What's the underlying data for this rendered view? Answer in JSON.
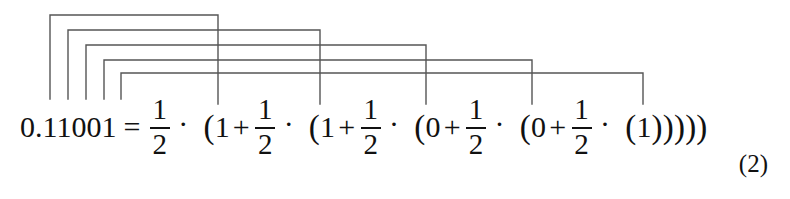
{
  "figure": {
    "kind": "math-equation-with-horner-brackets",
    "equation_number": "(2)",
    "ink_color": "#111111",
    "bracket_color": "#555555",
    "background": "#ffffff"
  },
  "equation": {
    "lhs": "0.11001",
    "equals": "=",
    "dot": "·",
    "plus": "+",
    "open_paren": "(",
    "close_paren": ")",
    "fraction": {
      "numerator": "1",
      "denominator": "2"
    },
    "terms": [
      {
        "digit": "1"
      },
      {
        "digit": "1"
      },
      {
        "digit": "0"
      },
      {
        "digit": "0"
      },
      {
        "digit": "1"
      }
    ],
    "closing_parens": ")))))",
    "plain_text": "0.11001 = 1/2 · (1 + 1/2 · (1 + 1/2 · (0 + 1/2 · (0 + 1/2 · (1)))))"
  },
  "brackets": {
    "description": "Five nested connector brackets linking each binary digit of 0.11001 to its matching term in the Horner expansion",
    "lines": [
      {
        "index": 1,
        "digit": "1",
        "x_start": 50,
        "x_end": 218,
        "y": 15,
        "y_drop_left": 99,
        "y_drop_right": 104
      },
      {
        "index": 2,
        "digit": "1",
        "x_start": 68,
        "x_end": 320,
        "y": 30,
        "y_drop_left": 99,
        "y_drop_right": 104
      },
      {
        "index": 3,
        "digit": "0",
        "x_start": 86,
        "x_end": 426,
        "y": 45,
        "y_drop_left": 99,
        "y_drop_right": 104
      },
      {
        "index": 4,
        "digit": "0",
        "x_start": 104,
        "x_end": 532,
        "y": 60,
        "y_drop_left": 99,
        "y_drop_right": 104
      },
      {
        "index": 5,
        "digit": "1",
        "x_start": 121,
        "x_end": 643,
        "y": 73,
        "y_drop_left": 99,
        "y_drop_right": 104
      }
    ]
  }
}
